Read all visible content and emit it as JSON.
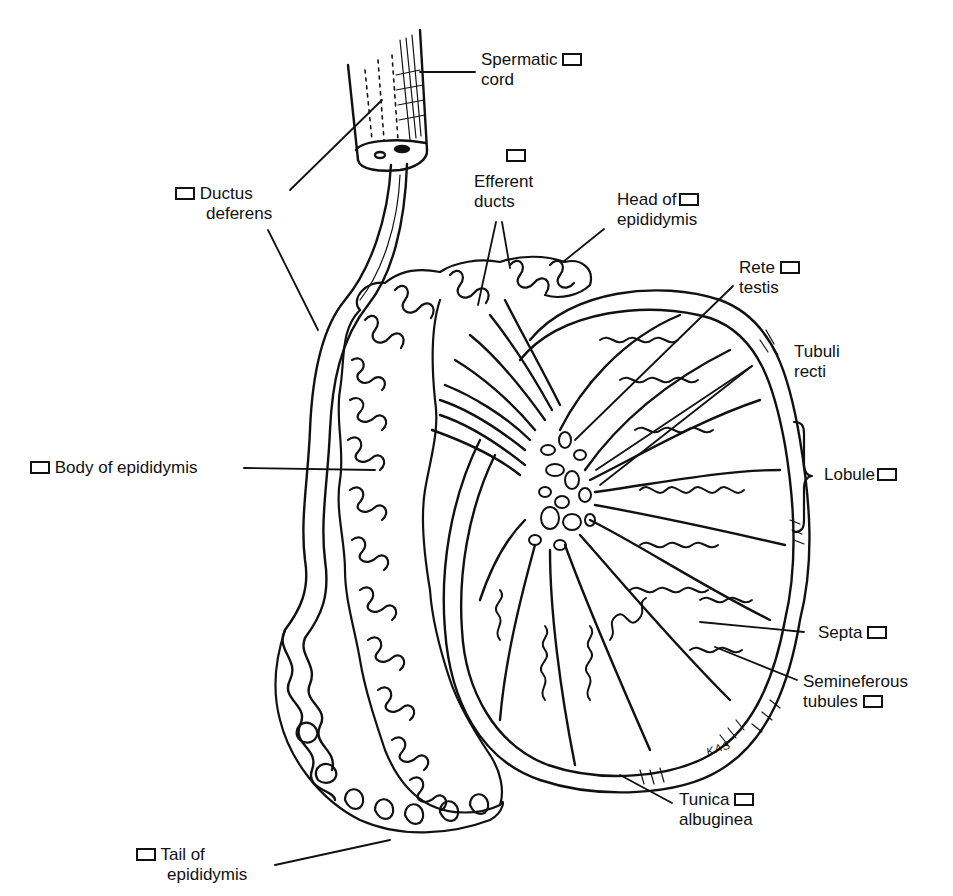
{
  "figure": {
    "artist_initials": "KAS",
    "colors": {
      "ink": "#111111",
      "paper": "#ffffff"
    }
  },
  "labels": [
    {
      "id": "spermatic-cord",
      "lines": [
        "Spermatic",
        "cord"
      ],
      "checkbox_position": "after-line-1",
      "checked": false
    },
    {
      "id": "ductus-deferens",
      "lines": [
        "Ductus",
        "deferens"
      ],
      "checkbox_position": "before-line-1",
      "checked": false
    },
    {
      "id": "efferent-ducts",
      "lines": [
        "Efferent",
        "ducts"
      ],
      "checkbox_position": "above",
      "checked": false
    },
    {
      "id": "head-of-epididymis",
      "lines": [
        "Head of",
        "epididymis"
      ],
      "checkbox_position": "after-line-1",
      "checked": false
    },
    {
      "id": "rete-testis",
      "lines": [
        "Rete",
        "testis"
      ],
      "checkbox_position": "after-line-1",
      "checked": false
    },
    {
      "id": "tubuli-recti",
      "lines": [
        "Tubuli",
        "recti"
      ],
      "checkbox_position": "none",
      "checked": false
    },
    {
      "id": "lobule",
      "lines": [
        "Lobule"
      ],
      "checkbox_position": "after-line-1",
      "checked": false
    },
    {
      "id": "body-of-epididymis",
      "lines": [
        "Body of epididymis"
      ],
      "checkbox_position": "before-line-1",
      "checked": false
    },
    {
      "id": "septa",
      "lines": [
        "Septa"
      ],
      "checkbox_position": "after-line-1",
      "checked": false
    },
    {
      "id": "seminiferous-tubules",
      "lines": [
        "Semineferous",
        "tubules"
      ],
      "checkbox_position": "after-line-2",
      "checked": false
    },
    {
      "id": "tunica-albuginea",
      "lines": [
        "Tunica",
        "albuginea"
      ],
      "checkbox_position": "after-line-1",
      "checked": false
    },
    {
      "id": "tail-of-epididymis",
      "lines": [
        "Tail of",
        "epididymis"
      ],
      "checkbox_position": "before-line-1",
      "checked": false
    }
  ]
}
